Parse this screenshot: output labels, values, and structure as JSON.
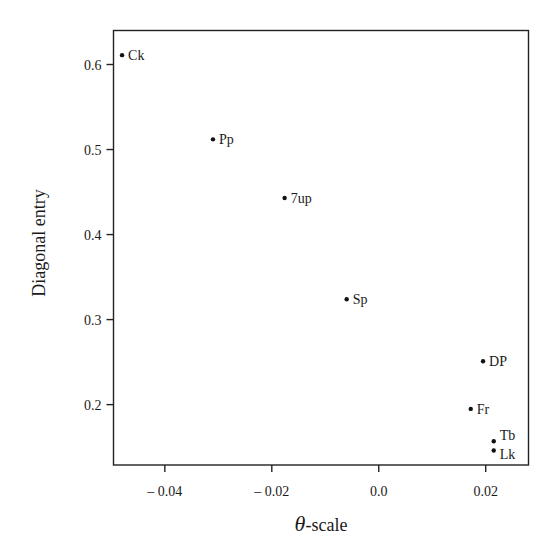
{
  "chart_data": {
    "type": "scatter",
    "title": "",
    "xlabel_symbol": "θ",
    "xlabel_suffix": "-scale",
    "xlabel": "θ-scale",
    "ylabel": "Diagonal entry",
    "xlim": [
      -0.0496,
      0.028
    ],
    "ylim": [
      0.129,
      0.64
    ],
    "grid": false,
    "legend": "none",
    "xticks": [
      {
        "value": -0.04,
        "label": "– 0.04"
      },
      {
        "value": -0.02,
        "label": "– 0.02"
      },
      {
        "value": 0.0,
        "label": "0.0"
      },
      {
        "value": 0.02,
        "label": "0.02"
      }
    ],
    "yticks": [
      {
        "value": 0.2,
        "label": "0.2"
      },
      {
        "value": 0.3,
        "label": "0.3"
      },
      {
        "value": 0.4,
        "label": "0.4"
      },
      {
        "value": 0.5,
        "label": "0.5"
      },
      {
        "value": 0.6,
        "label": "0.6"
      }
    ],
    "points": [
      {
        "label": "Ck",
        "x": -0.048,
        "y": 0.611
      },
      {
        "label": "Pp",
        "x": -0.031,
        "y": 0.512
      },
      {
        "label": "7up",
        "x": -0.0176,
        "y": 0.443
      },
      {
        "label": "Sp",
        "x": -0.006,
        "y": 0.324
      },
      {
        "label": "DP",
        "x": 0.0195,
        "y": 0.251
      },
      {
        "label": "Fr",
        "x": 0.0172,
        "y": 0.195
      },
      {
        "label": "Tb",
        "x": 0.0215,
        "y": 0.157
      },
      {
        "label": "Lk",
        "x": 0.0215,
        "y": 0.146
      }
    ]
  }
}
